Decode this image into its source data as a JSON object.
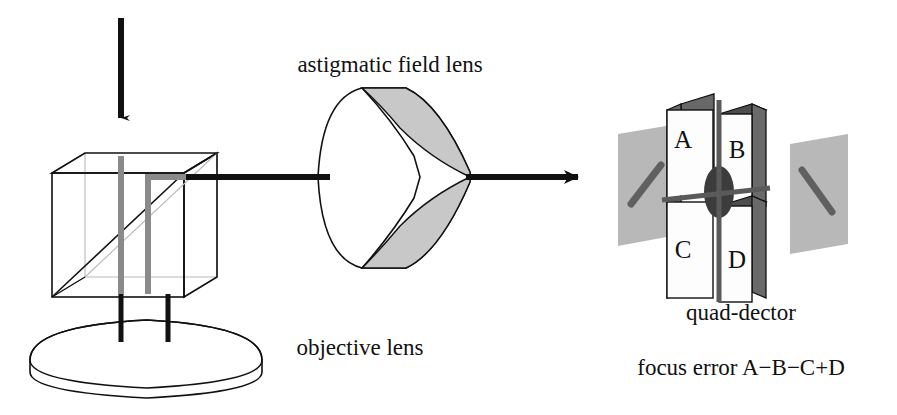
{
  "figure": {
    "background_color": "#ffffff",
    "width": 897,
    "height": 415
  },
  "labels": {
    "astigmatic_field_lens": "astigmatic field lens",
    "objective_lens": "objective lens",
    "quad_detector": "quad-dector",
    "focus_error": "focus error A−B−C+D"
  },
  "quadrants": {
    "top_left": "A",
    "top_right": "B",
    "bottom_left": "C",
    "bottom_right": "D"
  },
  "colors": {
    "ink": "#111111",
    "light_gray_fill": "#c8c8c8",
    "mid_gray": "#9a9a9a",
    "dark_gray_face": "#6a6a6a",
    "plane_gray": "#b5b5b5",
    "spot_dark": "#3a3a3a",
    "hidden_edge_gray": "#b9b9b9",
    "white_face": "#fdfdfd",
    "internal_beam_gray": "#8a8a8a"
  },
  "components": [
    {
      "name": "input-beam-arrow",
      "description": "incoming laser beam arrow pointing down into beam splitter"
    },
    {
      "name": "beam-splitter-cube",
      "description": "wireframe cube with internal 45 degree splitting diagonal"
    },
    {
      "name": "objective-lens",
      "description": "3D elliptical disc lens below the cube"
    },
    {
      "name": "astigmatic-field-lens",
      "description": "cylindrical lens with convex front and concave grooved rear face"
    },
    {
      "name": "quad-detector",
      "description": "four detector blocks A B C D arranged in a 2x2 grid"
    },
    {
      "name": "focus-plane-left",
      "description": "gray plane before focus with spot elongated along positive diagonal"
    },
    {
      "name": "focus-plane-right",
      "description": "gray plane after focus with spot elongated along negative diagonal"
    },
    {
      "name": "focus-spot-center",
      "description": "round beam spot centered on detector at exact focus"
    }
  ]
}
